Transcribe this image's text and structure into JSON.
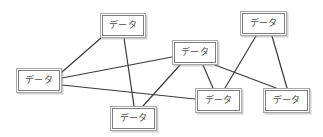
{
  "diagram": {
    "background_color": "#ffffff",
    "node_fill_color": "#ffffff",
    "node_border_color": "#7d7d7d",
    "node_outer_border_color": "#a8a8a8",
    "edge_color": "#3a3a3a",
    "label_color": "#4a4a4a",
    "width": 323,
    "height": 137,
    "node_label": "データ",
    "nodes": [
      {
        "id": "n1",
        "name": "node-top-left",
        "label": "データ",
        "x": 100,
        "y": 13,
        "w": 46,
        "h": 25
      },
      {
        "id": "n2",
        "name": "node-left",
        "label": "データ",
        "x": 16,
        "y": 68,
        "w": 46,
        "h": 25
      },
      {
        "id": "n3",
        "name": "node-center",
        "label": "データ",
        "x": 172,
        "y": 40,
        "w": 46,
        "h": 25
      },
      {
        "id": "n4",
        "name": "node-top-right",
        "label": "データ",
        "x": 240,
        "y": 11,
        "w": 47,
        "h": 25
      },
      {
        "id": "n5",
        "name": "node-bottom-left",
        "label": "データ",
        "x": 110,
        "y": 106,
        "w": 47,
        "h": 25
      },
      {
        "id": "n6",
        "name": "node-bottom-center",
        "label": "データ",
        "x": 195,
        "y": 88,
        "w": 47,
        "h": 25
      },
      {
        "id": "n7",
        "name": "node-bottom-right",
        "label": "データ",
        "x": 263,
        "y": 88,
        "w": 47,
        "h": 25
      }
    ],
    "edges": [
      {
        "name": "edge-left-to-top-left",
        "from": "n2",
        "to": "n1",
        "x1": 62,
        "y1": 72,
        "x2": 101,
        "y2": 38
      },
      {
        "name": "edge-left-to-center",
        "from": "n2",
        "to": "n3",
        "x1": 62,
        "y1": 78,
        "x2": 172,
        "y2": 57
      },
      {
        "name": "edge-left-to-bottom-center",
        "from": "n2",
        "to": "n6",
        "x1": 62,
        "y1": 85,
        "x2": 195,
        "y2": 99
      },
      {
        "name": "edge-top-left-to-bottom-left",
        "from": "n1",
        "to": "n5",
        "x1": 124,
        "y1": 38,
        "x2": 134,
        "y2": 106
      },
      {
        "name": "edge-center-to-bottom-left",
        "from": "n3",
        "to": "n5",
        "x1": 180,
        "y1": 65,
        "x2": 143,
        "y2": 106
      },
      {
        "name": "edge-center-to-bottom-center",
        "from": "n3",
        "to": "n6",
        "x1": 203,
        "y1": 65,
        "x2": 213,
        "y2": 88
      },
      {
        "name": "edge-center-to-bottom-right",
        "from": "n3",
        "to": "n7",
        "x1": 215,
        "y1": 65,
        "x2": 276,
        "y2": 88
      },
      {
        "name": "edge-top-right-to-bottom-center",
        "from": "n4",
        "to": "n6",
        "x1": 256,
        "y1": 36,
        "x2": 225,
        "y2": 88
      },
      {
        "name": "edge-top-right-to-bottom-right",
        "from": "n4",
        "to": "n7",
        "x1": 272,
        "y1": 36,
        "x2": 287,
        "y2": 88
      }
    ]
  }
}
